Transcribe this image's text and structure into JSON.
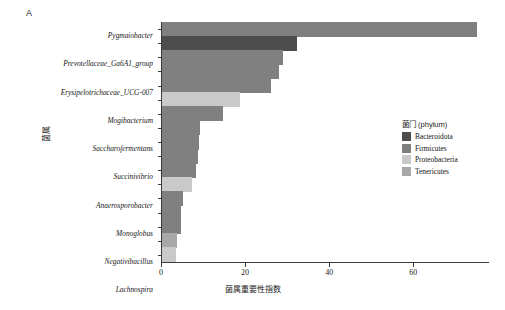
{
  "panel": {
    "label": "A"
  },
  "axes": {
    "x_title": "菌属重要性指数",
    "y_title": "菌属",
    "x_ticks": [
      "0",
      "20",
      "40",
      "60"
    ]
  },
  "legend": {
    "title": "菌门 (phylum)",
    "items": [
      {
        "label": "Bacteroidota",
        "color": "#4d4d4d"
      },
      {
        "label": "Firmicutes",
        "color": "#808080"
      },
      {
        "label": "Proteobacteria",
        "color": "#c9c9c9"
      },
      {
        "label": "Tenericutes",
        "color": "#a8a8a8"
      }
    ]
  },
  "chart_data": {
    "type": "bar",
    "orientation": "horizontal",
    "title": "",
    "xlabel": "菌属重要性指数",
    "ylabel": "菌属",
    "xlim": [
      0,
      78
    ],
    "xticks": [
      0,
      20,
      40,
      60
    ],
    "grid": false,
    "legend_position": "right",
    "legend_title": "菌门 (phylum)",
    "categories": [
      "Pygmaiobacter",
      "Prevotellaceae_Ga6A1_group",
      "Erysipelotrichaceae_UCG-007",
      "Mogibacterium",
      "Saccharofermentans",
      "Succinivibrio",
      "Anaerosporobacter",
      "Monoglobus",
      "Negativibacillus",
      "Lachnospira",
      "Blautia",
      "Mailhella",
      "Defluviitaleaceae_UCG-011",
      "Cellulosilyticum",
      "Atopostipes",
      "Anaeroplasma",
      "Ruminobacter"
    ],
    "values": [
      75.0,
      32.0,
      28.8,
      27.8,
      26.0,
      18.6,
      14.6,
      9.0,
      8.8,
      8.6,
      8.2,
      7.2,
      5.0,
      4.4,
      4.4,
      3.6,
      3.4
    ],
    "phylum": [
      "Firmicutes",
      "Bacteroidota",
      "Firmicutes",
      "Firmicutes",
      "Firmicutes",
      "Proteobacteria",
      "Firmicutes",
      "Firmicutes",
      "Firmicutes",
      "Firmicutes",
      "Firmicutes",
      "Proteobacteria",
      "Firmicutes",
      "Firmicutes",
      "Firmicutes",
      "Tenericutes",
      "Proteobacteria"
    ],
    "colors": {
      "Bacteroidota": "#4d4d4d",
      "Firmicutes": "#808080",
      "Proteobacteria": "#c9c9c9",
      "Tenericutes": "#a8a8a8"
    }
  }
}
